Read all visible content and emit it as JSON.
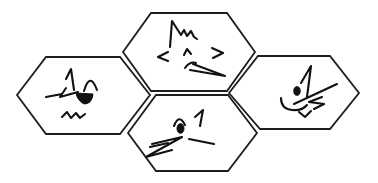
{
  "canvas": {
    "width": 378,
    "height": 183,
    "background_color": "#ffffff",
    "outline_color": "#1e1e1e",
    "doodle_color": "#111111",
    "figure_description": "Honeycomb cluster of four outlined hexagons, each containing a black hand-scribbled face doodle"
  },
  "figure": {
    "hexagons": [
      {
        "id": "left",
        "description": "winking cat face scribble: spiky left ear, arched right ear, zigzag wink line, filled grin, wavy chin line",
        "points": "17,95 46,57 120,57 150,95 120,134 46,134",
        "doodle_name": "winking-cat-face-doodle",
        "strokes": [
          "M 74,90 L 71,69 L 66,79",
          "M 84,91 Q 90,71 97,90",
          "M 46,97 L 62,94 L 66,88 L 60,97 L 78,92",
          "M 62,117 L 67,112 L 71,118 L 76,113 L 80,118 L 85,114"
        ],
        "fills": [
          "M 76,93 L 93,94 Q 92,104 84,104 Q 77,100 76,93 Z"
        ],
        "ellipses": []
      },
      {
        "id": "top",
        "description": "fox-like scribble: tall peak with small zigzag ridge, left and right angle brackets, caret nose, double-line arrow tail pointing down-right",
        "points": "123,52 151,13 227,13 255,52 227,91 151,91",
        "doodle_name": "fox-scribble-doodle",
        "strokes": [
          "M 170,47 L 172,21 L 181,35 L 184,30 L 187,36 L 191,31 L 194,37 L 197,39",
          "M 168,52 L 158,57 L 168,61",
          "M 184,55 L 187,49 L 191,54",
          "M 212,48 L 223,53 L 213,58",
          "M 185,68 Q 190,61 196,63",
          "M 193,64 L 225,76 L 190,70"
        ],
        "fills": [],
        "ellipses": []
      },
      {
        "id": "bottom",
        "description": "scribble with arched eyebrow over filled dot eye, handwritten numeral 1, lightning Z zigzag, short slanted dash",
        "points": "128,133 156,95 228,95 257,133 228,171 156,171",
        "doodle_name": "dot-eye-numeral-doodle",
        "strokes": [
          "M 174,126 Q 179,113 185,125",
          "M 195,117 L 203,110 L 200,126",
          "M 152,144 L 182,137 L 146,157 L 172,150",
          "M 150,147 L 168,143",
          "M 189,139 L 214,144"
        ],
        "fills": [],
        "ellipses": [
          {
            "cx": 180.5,
            "cy": 128.5,
            "rx": 3.5,
            "ry": 4.8
          }
        ]
      },
      {
        "id": "right",
        "description": "cat face scribble: triangular 1-shaped ear, filled dot eye, long whisker line, small z zigzag, smile arc, small v chin",
        "points": "229,93 258,56 330,56 359,93 330,129 260,129",
        "doodle_name": "dotted-eye-cat-doodle",
        "strokes": [
          "M 301,83 L 311,66 L 307,97",
          "M 294,104 L 337,84",
          "M 322,97 L 309,102 L 324,104 L 314,109",
          "M 281,98 Q 281,109 292,110 Q 302,111 307,105",
          "M 299,112 L 305,117 L 311,111"
        ],
        "fills": [],
        "ellipses": [
          {
            "cx": 297,
            "cy": 91,
            "rx": 3.2,
            "ry": 4.3
          }
        ]
      }
    ]
  }
}
